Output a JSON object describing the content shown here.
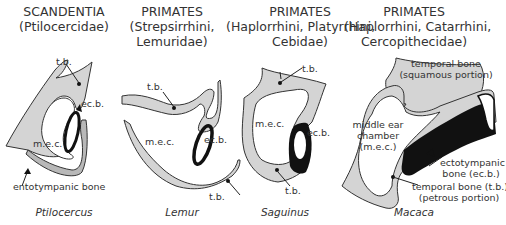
{
  "panels": [
    {
      "order": "SCANDENTIA",
      "family": "(Ptilocercidae)",
      "genus": "Ptilocercus",
      "labels": {
        "tb": "t.b.",
        "ecb": "ec.b.",
        "mec": "m.e.c.",
        "ento": "entotympanic bone"
      }
    },
    {
      "order": "PRIMATES",
      "family_line1": "(Strepsirrhini,",
      "family_line2": "Lemuridae)",
      "genus": "Lemur",
      "labels": {
        "tb_top": "t.b.",
        "ecb": "ec.b.",
        "mec": "m.e.c.",
        "tb_bottom": "t.b."
      }
    },
    {
      "order": "PRIMATES",
      "family_line1": "(Haplorrhini, Platyrrhini,",
      "family_line2": "Cebidae)",
      "genus": "Saguinus",
      "labels": {
        "tb_top": "t.b.",
        "ecb": "ec.b.",
        "mec": "m.e.c.",
        "tb_bottom": "t.b."
      }
    },
    {
      "order": "PRIMATES",
      "family_line1": "(Haplorrhini, Catarrhini,",
      "family_line2": "Cercopithecidae)",
      "genus": "Macaca",
      "labels": {
        "squamous_1": "temporal bone",
        "squamous_2": "(squamous portion)",
        "mec_1": "middle ear",
        "mec_2": "chamber",
        "mec_3": "(m.e.c.)",
        "ecb_1": "ectotympanic",
        "ecb_2": "bone (ec.b.)",
        "petrous_1": "temporal bone (t.b.)",
        "petrous_2": "(petrous portion)"
      }
    }
  ],
  "colors": {
    "bone": "#d4d4d4",
    "ectotympanic": "#111111",
    "outline": "#333333",
    "background": "#ffffff"
  }
}
